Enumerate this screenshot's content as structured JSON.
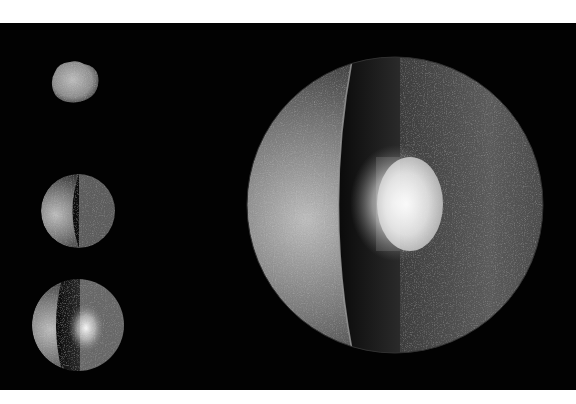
{
  "figure": {
    "background": "#020202",
    "border_color": "#ffffff",
    "stages": [
      {
        "id": "stage-1",
        "description": "Undifferentiated rubble aggregate",
        "cx": 72,
        "cy": 82,
        "rx": 21,
        "ry": 17
      },
      {
        "id": "stage-2",
        "description": "Rounded body, cut-away cross section",
        "cx": 78,
        "cy": 211,
        "r": 37
      },
      {
        "id": "stage-3",
        "description": "Body with forming bright core",
        "cx": 78,
        "cy": 325,
        "r": 46
      },
      {
        "id": "stage-4",
        "description": "Fully differentiated body with bright core and crust",
        "cx": 395,
        "cy": 205,
        "r": 148
      }
    ],
    "colors": {
      "surface_light": "#c9c9c9",
      "surface_dark": "#2a2a2a",
      "interior": "#5a5a5a",
      "core": "#f2f2f2"
    }
  }
}
